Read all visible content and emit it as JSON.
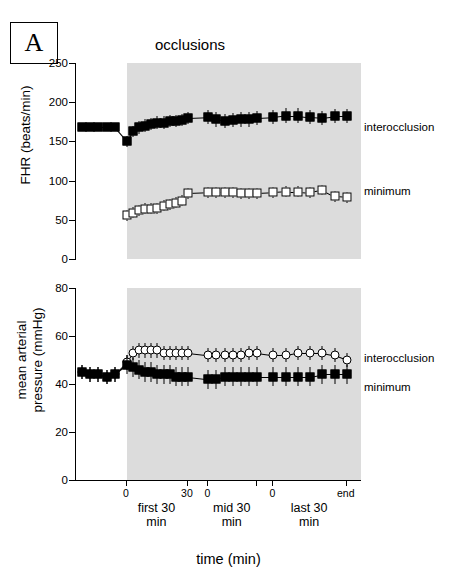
{
  "panel": {
    "label": "A"
  },
  "title": "occlusions",
  "axis_x": {
    "title": "time (min)"
  },
  "groups": [
    {
      "label_line1": "first 30",
      "label_line2": "min",
      "start_tick": "0",
      "end_tick": "30"
    },
    {
      "label_line1": "mid 30",
      "label_line2": "min",
      "start_tick": "0",
      "end_tick": ""
    },
    {
      "label_line1": "last 30",
      "label_line2": "min",
      "start_tick": "0",
      "end_tick": "end"
    }
  ],
  "chart_data": [
    {
      "type": "line",
      "id": "fhr",
      "title": "occlusions",
      "xlabel": "time (min)",
      "ylabel": "FHR (beats/min)",
      "ylim": [
        0,
        250
      ],
      "yticks": [
        0,
        50,
        100,
        150,
        200,
        250
      ],
      "grid": false,
      "shaded_region": "occlusions",
      "legend_position": "right",
      "series": [
        {
          "name": "interocclusion",
          "marker": "filled-square",
          "x": [
            -22,
            -18,
            -14,
            -10,
            -6,
            0,
            3,
            6,
            9,
            12,
            15,
            18,
            21,
            24,
            27,
            30,
            40,
            44,
            48,
            52,
            56,
            60,
            64,
            72,
            78,
            84,
            90,
            96,
            102,
            108
          ],
          "values": [
            168,
            168,
            168,
            168,
            168,
            150,
            163,
            168,
            170,
            172,
            174,
            174,
            176,
            176,
            177,
            180,
            181,
            178,
            176,
            177,
            178,
            178,
            180,
            181,
            183,
            183,
            181,
            180,
            182,
            182
          ],
          "errors": [
            5,
            5,
            5,
            5,
            5,
            7,
            7,
            8,
            8,
            8,
            8,
            8,
            8,
            8,
            8,
            8,
            9,
            9,
            9,
            9,
            9,
            9,
            9,
            9,
            9,
            9,
            9,
            9,
            9,
            9
          ]
        },
        {
          "name": "minimum",
          "marker": "open-square",
          "x": [
            0,
            3,
            6,
            9,
            12,
            15,
            18,
            21,
            24,
            27,
            30,
            40,
            44,
            48,
            52,
            56,
            60,
            64,
            72,
            78,
            84,
            90,
            96,
            102,
            108
          ],
          "values": [
            56,
            59,
            62,
            64,
            64,
            65,
            68,
            70,
            72,
            74,
            84,
            85,
            85,
            85,
            85,
            84,
            84,
            84,
            85,
            86,
            86,
            85,
            88,
            80,
            79
          ],
          "errors": [
            7,
            7,
            7,
            7,
            7,
            7,
            7,
            7,
            7,
            7,
            7,
            7,
            7,
            7,
            7,
            7,
            7,
            7,
            7,
            7,
            7,
            7,
            7,
            7,
            7
          ]
        }
      ]
    },
    {
      "type": "line",
      "id": "map",
      "xlabel": "time (min)",
      "ylabel": "mean arterial pressure (mmHg)",
      "ylim": [
        0,
        80
      ],
      "yticks": [
        0,
        20,
        40,
        60,
        80
      ],
      "grid": false,
      "shaded_region": "occlusions",
      "legend_position": "right",
      "series": [
        {
          "name": "interocclusion",
          "marker": "open-circle",
          "x": [
            -22,
            -18,
            -14,
            -10,
            -6,
            0,
            3,
            6,
            9,
            12,
            15,
            18,
            21,
            24,
            27,
            30,
            40,
            44,
            48,
            52,
            56,
            60,
            64,
            72,
            78,
            84,
            90,
            96,
            102,
            108
          ],
          "values": [
            45,
            44,
            44,
            43,
            44,
            49,
            53,
            54,
            54,
            54,
            54,
            53,
            53,
            53,
            53,
            53,
            52,
            52,
            52,
            52,
            52,
            53,
            53,
            52,
            52,
            53,
            53,
            53,
            52,
            50
          ],
          "errors": [
            3,
            3,
            3,
            3,
            3,
            3,
            3,
            3,
            3,
            3,
            3,
            3,
            3,
            3,
            3,
            3,
            3,
            3,
            3,
            3,
            3,
            3,
            3,
            3,
            3,
            3,
            3,
            3,
            3,
            3
          ]
        },
        {
          "name": "minimum",
          "marker": "filled-square",
          "x": [
            -22,
            -18,
            -14,
            -10,
            -6,
            0,
            3,
            6,
            9,
            12,
            15,
            18,
            21,
            24,
            27,
            30,
            40,
            44,
            48,
            52,
            56,
            60,
            64,
            72,
            78,
            84,
            90,
            96,
            102,
            108
          ],
          "values": [
            45,
            44,
            44,
            43,
            44,
            48,
            47,
            46,
            45,
            45,
            44,
            44,
            44,
            43,
            43,
            43,
            42,
            42,
            43,
            43,
            43,
            43,
            43,
            43,
            43,
            43,
            43,
            44,
            44,
            44
          ],
          "errors": [
            3,
            3,
            3,
            3,
            3,
            4,
            4,
            4,
            4,
            4,
            4,
            4,
            4,
            4,
            4,
            4,
            4,
            4,
            4,
            4,
            4,
            4,
            4,
            4,
            4,
            4,
            4,
            4,
            4,
            4
          ]
        }
      ]
    }
  ],
  "annotations": {
    "fhr_interocclusion": "interocclusion",
    "fhr_minimum": "minimum",
    "map_interocclusion": "interocclusion",
    "map_minimum": "minimum"
  }
}
